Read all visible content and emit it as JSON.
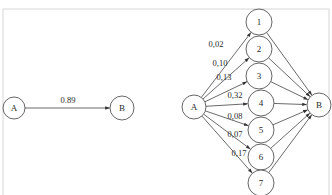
{
  "diagram": {
    "type": "directed-graph",
    "panels": [
      {
        "id": "left",
        "nodes": [
          {
            "id": "A",
            "label": "A",
            "x": 14,
            "y": 108,
            "r": 11
          },
          {
            "id": "B",
            "label": "B",
            "x": 122,
            "y": 108,
            "r": 12
          }
        ],
        "edges": [
          {
            "from": "A",
            "to": "B",
            "label": "0.89",
            "lx": 68,
            "ly": 103
          }
        ]
      },
      {
        "id": "right",
        "nodes": [
          {
            "id": "A",
            "label": "A",
            "x": 194,
            "y": 107,
            "r": 12
          },
          {
            "id": "n1",
            "label": "1",
            "x": 259,
            "y": 22,
            "r": 13
          },
          {
            "id": "n2",
            "label": "2",
            "x": 259,
            "y": 49,
            "r": 13
          },
          {
            "id": "n3",
            "label": "3",
            "x": 259,
            "y": 76,
            "r": 13
          },
          {
            "id": "n4",
            "label": "4",
            "x": 261,
            "y": 103,
            "r": 13
          },
          {
            "id": "n5",
            "label": "5",
            "x": 261,
            "y": 130,
            "r": 13
          },
          {
            "id": "n6",
            "label": "6",
            "x": 261,
            "y": 157,
            "r": 13
          },
          {
            "id": "n7",
            "label": "7",
            "x": 261,
            "y": 183,
            "r": 13
          },
          {
            "id": "B",
            "label": "B",
            "x": 319,
            "y": 105,
            "r": 12
          }
        ],
        "edges": [
          {
            "from": "A",
            "to": "n1",
            "label": "0,02",
            "lx": 216,
            "ly": 47
          },
          {
            "from": "A",
            "to": "n2",
            "label": "0,10",
            "lx": 220,
            "ly": 66
          },
          {
            "from": "A",
            "to": "n3",
            "label": "0,13",
            "lx": 224,
            "ly": 80
          },
          {
            "from": "A",
            "to": "n4",
            "label": "0,32",
            "lx": 235,
            "ly": 98
          },
          {
            "from": "A",
            "to": "n5",
            "label": "0,08",
            "lx": 235,
            "ly": 119
          },
          {
            "from": "A",
            "to": "n6",
            "label": "0,07",
            "lx": 235,
            "ly": 137
          },
          {
            "from": "A",
            "to": "n7",
            "label": "0,17",
            "lx": 239,
            "ly": 156
          },
          {
            "from": "n1",
            "to": "B",
            "label": ""
          },
          {
            "from": "n2",
            "to": "B",
            "label": ""
          },
          {
            "from": "n3",
            "to": "B",
            "label": ""
          },
          {
            "from": "n4",
            "to": "B",
            "label": ""
          },
          {
            "from": "n5",
            "to": "B",
            "label": ""
          },
          {
            "from": "n6",
            "to": "B",
            "label": ""
          },
          {
            "from": "n7",
            "to": "B",
            "label": ""
          }
        ]
      }
    ]
  },
  "colors": {
    "stroke": "#444444",
    "node_stroke": "#555555",
    "background": "#ffffff",
    "frame": "#d6d6d6"
  }
}
